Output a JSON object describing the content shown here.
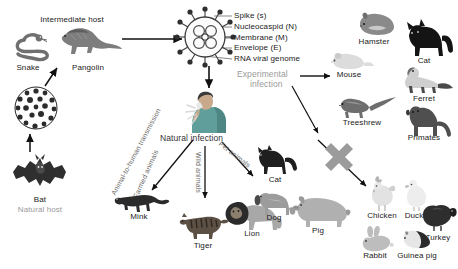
{
  "figure": {
    "background_color": "#ffffff"
  },
  "colors": {
    "ink": "#1a1a1a",
    "gray_text": "#9a9a9a",
    "mid_text": "#6e6e6e",
    "arrow": "#111111",
    "cross_mark": "#9b9b9b",
    "human_shirt": "#5f9e9a",
    "human_skin": "#c8a98c",
    "virus_body": "#f2f2f2",
    "virus_outline": "#4a4a4a",
    "dark_animal": "#2b2b2b",
    "mid_animal": "#6f6f6f",
    "light_animal": "#c9c9c9"
  },
  "sections": {
    "intermediate_host": {
      "heading": "Intermediate host",
      "animals": [
        {
          "name": "Snake",
          "icon": "snake-icon"
        },
        {
          "name": "Pangolin",
          "icon": "pangolin-icon"
        }
      ]
    },
    "natural_host": {
      "heading": "Natural host",
      "animals": [
        {
          "name": "Bat",
          "icon": "bat-icon"
        }
      ]
    },
    "virus": {
      "icon": "coronavirus-icon",
      "labels": [
        "Spike (s)",
        "Nucleocaspid (N)",
        "Membrane (M)",
        "Envelope (E)",
        "RNA viral genome"
      ]
    },
    "human": {
      "icon": "coughing-person-icon",
      "alt": "Infected human coughing"
    },
    "natural_infection": {
      "heading": "Natural infection",
      "routes": [
        {
          "label": "Animal-to-human transmission",
          "direction": "left"
        },
        {
          "label": "Farmed animals",
          "direction": "left"
        },
        {
          "label": "Wild animals",
          "direction": "down"
        },
        {
          "label": "Pet animals",
          "direction": "right"
        }
      ],
      "farmed_animals": [
        {
          "name": "Mink",
          "icon": "mink-icon"
        }
      ],
      "wild_animals": [
        {
          "name": "Tiger",
          "icon": "tiger-icon"
        },
        {
          "name": "Lion",
          "icon": "lion-icon"
        }
      ],
      "pet_animals": [
        {
          "name": "Cat",
          "icon": "cat-icon"
        },
        {
          "name": "Dog",
          "icon": "dog-icon"
        }
      ]
    },
    "experimental_infection": {
      "heading_line1": "Experimental",
      "heading_line2": "infection",
      "susceptible_animals": [
        {
          "name": "Hamster",
          "icon": "hamster-icon"
        },
        {
          "name": "Cat",
          "icon": "cat-icon"
        },
        {
          "name": "Mouse",
          "icon": "mouse-icon"
        },
        {
          "name": "Ferret",
          "icon": "ferret-icon"
        },
        {
          "name": "Treeshrew",
          "icon": "treeshrew-icon"
        },
        {
          "name": "Primates",
          "icon": "primate-icon"
        }
      ]
    },
    "non_susceptible": {
      "marker": "cross-mark-icon",
      "animals": [
        {
          "name": "Pig",
          "icon": "pig-icon"
        },
        {
          "name": "Chicken",
          "icon": "chicken-icon"
        },
        {
          "name": "Duck",
          "icon": "duck-icon"
        },
        {
          "name": "Turkey",
          "icon": "turkey-icon"
        },
        {
          "name": "Rabbit",
          "icon": "rabbit-icon"
        },
        {
          "name": "Guinea pig",
          "icon": "guinea-pig-icon"
        }
      ]
    }
  }
}
